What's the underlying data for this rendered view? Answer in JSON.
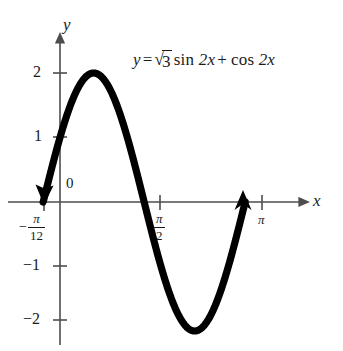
{
  "figure": {
    "name": "trigonometric-graph",
    "equation": {
      "lhs": "y",
      "equals": "=",
      "radicand": "3",
      "sqrt_glyph": "√",
      "term1_fn": "sin",
      "term1_arg": "2x",
      "plus": "+",
      "term2_fn": "cos",
      "term2_arg": "2x",
      "plain": "y = √3 sin 2x + cos 2x"
    },
    "axes": {
      "x_label": "x",
      "y_label": "y",
      "origin_label": "0",
      "x_ticks": [
        {
          "label_minus": "−",
          "num": "π",
          "den": "12",
          "kind": "fraction",
          "value": -0.2618
        },
        {
          "label": "π",
          "den": "2",
          "num": "π",
          "kind": "fraction",
          "value": 1.5708
        },
        {
          "label": "π",
          "kind": "plain",
          "value": 3.1416
        }
      ],
      "y_ticks": [
        {
          "label": "2",
          "value": 2
        },
        {
          "label": "1",
          "value": 1
        },
        {
          "label": "−1",
          "value": -1
        },
        {
          "label": "−2",
          "value": -2
        }
      ]
    },
    "colors": {
      "curve": "#000000",
      "axis": "#4d4d4d",
      "text": "#1a1a1a",
      "background": "#ffffff"
    }
  },
  "chart_data": {
    "type": "line",
    "title": "",
    "xlabel": "x",
    "ylabel": "y",
    "function": "y = sqrt(3)*sin(2x) + cos(2x) = 2*sin(2x + pi/6)",
    "amplitude": 2,
    "period": 3.14159,
    "phase_shift": -0.2618,
    "xlim": [
      -0.2618,
      2.8798
    ],
    "ylim": [
      -2,
      2
    ],
    "grid": false,
    "legend": false,
    "x_tick_values": [
      -0.2618,
      1.5708,
      3.1416
    ],
    "x_tick_labels": [
      "-π/12",
      "π/2",
      "π"
    ],
    "y_tick_values": [
      2,
      1,
      -1,
      -2
    ],
    "y_tick_labels": [
      "2",
      "1",
      "−1",
      "−2"
    ],
    "key_points": [
      {
        "x": -0.2618,
        "y": 0,
        "note": "start, arrowhead, x = -π/12"
      },
      {
        "x": 0,
        "y": 1,
        "note": "y-intercept"
      },
      {
        "x": 0.5236,
        "y": 2,
        "note": "maximum, x = π/6"
      },
      {
        "x": 1.309,
        "y": 0,
        "note": "zero crossing"
      },
      {
        "x": 2.0944,
        "y": -2,
        "note": "minimum, x = 2π/3"
      },
      {
        "x": 2.8798,
        "y": 0,
        "note": "end, arrowhead"
      }
    ]
  }
}
